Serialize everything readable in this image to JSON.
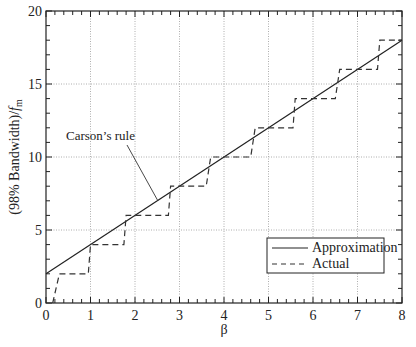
{
  "chart_data": {
    "type": "line",
    "title": "",
    "xlabel": "β",
    "ylabel": "(98% Bandwidth)/f",
    "ylabel_sub": "m",
    "xlim": [
      0,
      8
    ],
    "ylim": [
      0,
      20
    ],
    "xticks": [
      0,
      1,
      2,
      3,
      4,
      5,
      6,
      7,
      8
    ],
    "yticks": [
      0,
      5,
      10,
      15,
      20
    ],
    "grid": true,
    "legend_position": "lower right",
    "series": [
      {
        "name": "Approximation",
        "style": "solid",
        "x": [
          0,
          8
        ],
        "y": [
          2,
          18
        ]
      },
      {
        "name": "Actual",
        "style": "dashed",
        "x": [
          0.15,
          0.3,
          0.95,
          1.0,
          1.75,
          1.8,
          2.75,
          2.8,
          3.6,
          3.7,
          4.6,
          4.7,
          5.55,
          5.6,
          6.5,
          6.6,
          7.45,
          7.5,
          8.0
        ],
        "y": [
          0,
          2,
          2,
          4,
          4,
          6,
          6,
          8,
          8,
          10,
          10,
          12,
          12,
          14,
          14,
          16,
          16,
          18,
          18
        ]
      }
    ],
    "annotations": [
      {
        "text": "Carson’s rule",
        "points_to": {
          "x": 2.5,
          "y": 7
        }
      }
    ]
  },
  "legend": {
    "items": [
      {
        "label": "Approximation"
      },
      {
        "label": "Actual"
      }
    ]
  },
  "annotation": {
    "carson": "Carson’s rule"
  },
  "axes": {
    "xlabel": "β",
    "ylabel_main": "(98% Bandwidth)/",
    "ylabel_f": "f",
    "ylabel_sub": "m"
  }
}
